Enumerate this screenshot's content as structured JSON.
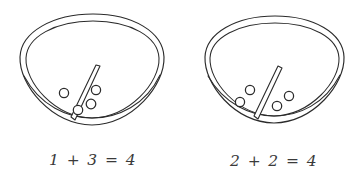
{
  "page": {
    "background_color": "#ffffff",
    "ink_color": "#2b2b2b",
    "caption_color": "#3a3a3a",
    "width": 359,
    "height": 179
  },
  "groups": [
    {
      "id": "left-bowl-group",
      "name": "bowl-one",
      "caption": "1 + 3 = 4",
      "addend_left": 1,
      "addend_right": 3,
      "sum": 4,
      "counters_left_of_divider": 1,
      "counters_right_of_divider": 3,
      "total_counters": 4,
      "divider_label": "divider-wedge",
      "bowl_label": "bowl-outline"
    },
    {
      "id": "right-bowl-group",
      "name": "bowl-two",
      "caption": "2 + 2 = 4",
      "addend_left": 2,
      "addend_right": 2,
      "sum": 4,
      "counters_left_of_divider": 2,
      "counters_right_of_divider": 2,
      "total_counters": 4,
      "divider_label": "divider-wedge",
      "bowl_label": "bowl-outline"
    }
  ]
}
